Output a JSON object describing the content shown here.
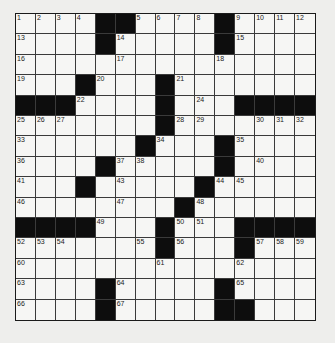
{
  "puzzle": {
    "size": 15,
    "colors": {
      "black": "#0d0d0d",
      "white": "#f6f6f4",
      "border": "#1a1a1a",
      "background": "#eeeeec"
    },
    "rows": [
      "....##....#....",
      "....#.....#....",
      "...............",
      "...#...#.......",
      "###....#...####",
      ".......#.......",
      "......#...#....",
      "....#.....#....",
      "...#.....#.....",
      "........#......",
      "####...#...####",
      ".......#...#...",
      "...............",
      "....#.....#....",
      "....#.....##..."
    ],
    "numbers": [
      [
        1,
        2,
        3,
        4,
        0,
        0,
        5,
        6,
        7,
        8,
        0,
        9,
        10,
        11,
        12
      ],
      [
        13,
        0,
        0,
        0,
        0,
        14,
        0,
        0,
        0,
        0,
        0,
        15,
        0,
        0,
        0
      ],
      [
        16,
        0,
        0,
        0,
        0,
        17,
        0,
        0,
        0,
        0,
        18,
        0,
        0,
        0,
        0
      ],
      [
        19,
        0,
        0,
        0,
        20,
        0,
        0,
        0,
        21,
        0,
        0,
        0,
        0,
        0,
        0
      ],
      [
        0,
        0,
        0,
        22,
        0,
        0,
        0,
        23,
        0,
        24,
        0,
        0,
        0,
        0,
        0
      ],
      [
        25,
        26,
        27,
        0,
        0,
        0,
        0,
        0,
        28,
        29,
        0,
        0,
        30,
        31,
        32
      ],
      [
        33,
        0,
        0,
        0,
        0,
        0,
        0,
        34,
        0,
        0,
        0,
        35,
        0,
        0,
        0
      ],
      [
        36,
        0,
        0,
        0,
        0,
        37,
        38,
        0,
        0,
        0,
        39,
        0,
        40,
        0,
        0
      ],
      [
        41,
        0,
        0,
        42,
        0,
        43,
        0,
        0,
        0,
        0,
        44,
        45,
        0,
        0,
        0
      ],
      [
        46,
        0,
        0,
        0,
        0,
        47,
        0,
        0,
        0,
        48,
        0,
        0,
        0,
        0,
        0
      ],
      [
        0,
        0,
        0,
        0,
        49,
        0,
        0,
        0,
        50,
        51,
        0,
        0,
        0,
        0,
        0
      ],
      [
        52,
        53,
        54,
        0,
        0,
        0,
        55,
        0,
        56,
        0,
        0,
        0,
        57,
        58,
        59
      ],
      [
        60,
        0,
        0,
        0,
        0,
        0,
        0,
        61,
        0,
        0,
        0,
        62,
        0,
        0,
        0
      ],
      [
        63,
        0,
        0,
        0,
        0,
        64,
        0,
        0,
        0,
        0,
        0,
        65,
        0,
        0,
        0
      ],
      [
        66,
        0,
        0,
        0,
        0,
        67,
        0,
        0,
        0,
        0,
        0,
        68,
        0,
        0,
        0
      ]
    ]
  }
}
